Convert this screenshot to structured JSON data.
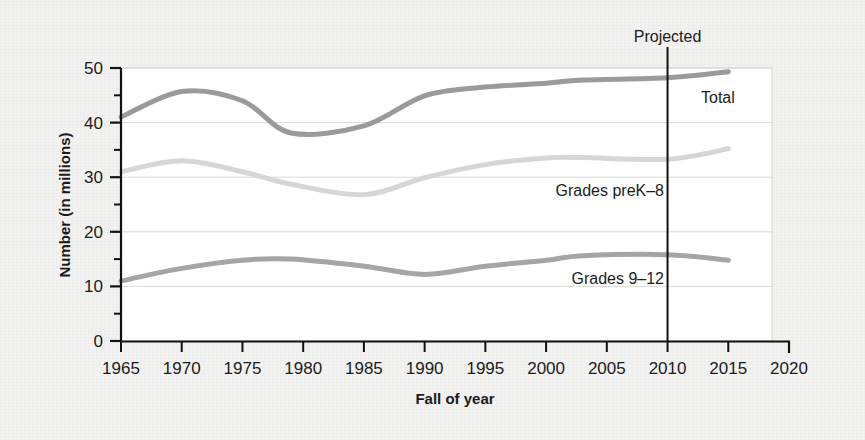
{
  "figure": {
    "background_color": "#f2f2f0",
    "panel_color": "#ffffff",
    "panel_border_color": "#cfcfcf",
    "axis_color": "#111111",
    "grid_color": "#d8d8d8"
  },
  "chart_data": {
    "type": "line",
    "title": "",
    "xlabel": "Fall of year",
    "ylabel": "Number (in millions)",
    "xlim": [
      1965,
      2020
    ],
    "ylim": [
      0,
      50
    ],
    "xticks": [
      1965,
      1970,
      1975,
      1980,
      1985,
      1990,
      1995,
      2000,
      2005,
      2010,
      2015,
      2020
    ],
    "xtick_labels": [
      "1965",
      "1970",
      "1975",
      "1980",
      "1985",
      "1990",
      "1995",
      "2000",
      "2005",
      "2010",
      "2015",
      "2020"
    ],
    "yticks": [
      0,
      10,
      20,
      30,
      40,
      50
    ],
    "ytick_labels": [
      "0",
      "10",
      "20",
      "30",
      "40",
      "50"
    ],
    "yminor_ticks": [
      5,
      15,
      25,
      35,
      45
    ],
    "grid": "horizontal-major",
    "legend": "inline-labels",
    "x": [
      1965,
      1970,
      1975,
      1979,
      1985,
      1990,
      1995,
      2000,
      2003,
      2010,
      2015
    ],
    "series": [
      {
        "name": "Total",
        "label": "Total",
        "color": "#9a9a9a",
        "values": [
          41.0,
          45.7,
          44.0,
          38.1,
          39.4,
          44.9,
          46.5,
          47.2,
          47.8,
          48.2,
          49.3
        ]
      },
      {
        "name": "Grades preK-8",
        "label": "Grades preK–8",
        "color": "#d6d6d6",
        "values": [
          31.0,
          33.0,
          31.0,
          28.7,
          26.8,
          29.9,
          32.3,
          33.5,
          33.6,
          33.3,
          35.2
        ]
      },
      {
        "name": "Grades 9-12",
        "label": "Grades 9–12",
        "color": "#a5a5a5",
        "values": [
          11.0,
          13.3,
          14.8,
          15.0,
          13.7,
          12.2,
          13.7,
          14.8,
          15.6,
          15.8,
          14.8
        ]
      }
    ],
    "annotations": [
      {
        "name": "projected-divider",
        "label": "Projected",
        "x": 2010,
        "type": "vertical-line",
        "color": "#000000"
      }
    ]
  }
}
